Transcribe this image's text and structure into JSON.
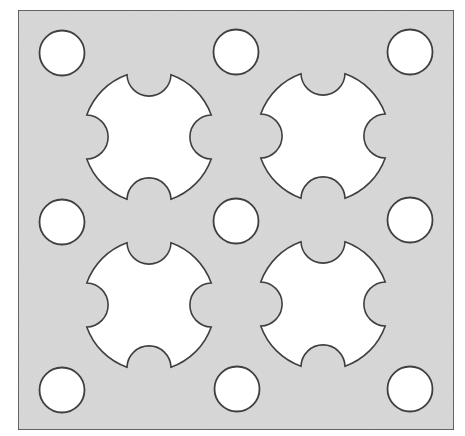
{
  "canvas": {
    "width": 465,
    "height": 436,
    "background": "#ffffff"
  },
  "colors": {
    "plate_fill": "#d8d8d8",
    "outline": "#3f3f3f",
    "hole_fill": "#ffffff"
  },
  "plate": {
    "x": 18,
    "y": 10,
    "width": 436,
    "height": 420,
    "stroke_width": 1.6
  },
  "circular_holes": {
    "radius": 22.5,
    "stroke_width": 1.8,
    "items": [
      {
        "cx": 62,
        "cy": 53
      },
      {
        "cx": 236,
        "cy": 52
      },
      {
        "cx": 410,
        "cy": 52
      },
      {
        "cx": 62,
        "cy": 222
      },
      {
        "cx": 236,
        "cy": 221
      },
      {
        "cx": 410,
        "cy": 220
      },
      {
        "cx": 62,
        "cy": 390
      },
      {
        "cx": 237,
        "cy": 389
      },
      {
        "cx": 410,
        "cy": 389
      }
    ]
  },
  "cross_cutouts": {
    "outer_radius": 66,
    "notch_radius": 22,
    "notch_offset": 63,
    "stroke_width": 1.6,
    "items": [
      {
        "cx": 149,
        "cy": 137
      },
      {
        "cx": 323,
        "cy": 136
      },
      {
        "cx": 149,
        "cy": 305
      },
      {
        "cx": 323,
        "cy": 304
      }
    ]
  }
}
